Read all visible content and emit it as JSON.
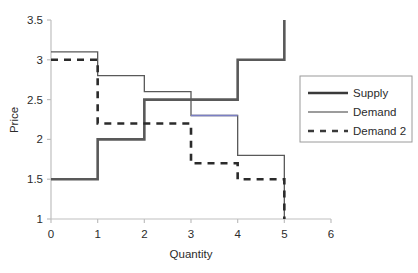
{
  "chart_data": {
    "type": "line",
    "subtype": "step",
    "title": "",
    "xlabel": "Quantity",
    "ylabel": "Price",
    "xlim": [
      0,
      6
    ],
    "ylim": [
      1,
      3.5
    ],
    "xticks": [
      "0",
      "1",
      "2",
      "3",
      "4",
      "5",
      "6"
    ],
    "xtick_values": [
      0,
      1,
      2,
      3,
      4,
      5,
      6
    ],
    "yticks": [
      "1",
      "1.5",
      "2",
      "2.5",
      "3",
      "3.5"
    ],
    "ytick_values": [
      1,
      1.5,
      2,
      2.5,
      3,
      3.5
    ],
    "grid": false,
    "legend_position": "right",
    "series": [
      {
        "name": "Supply",
        "style": "thick-solid",
        "color": "#595959",
        "steps": [
          {
            "x_start": 0,
            "x_end": 1,
            "y": 1.5
          },
          {
            "x_start": 1,
            "x_end": 2,
            "y": 2.0
          },
          {
            "x_start": 2,
            "x_end": 4,
            "y": 2.5
          },
          {
            "x_start": 4,
            "x_end": 5,
            "y": 3.0
          },
          {
            "x_start": 5,
            "x_end": 5,
            "y": 3.5
          }
        ]
      },
      {
        "name": "Demand",
        "style": "thin-solid",
        "color": "#595959",
        "accent_color": "#7b7fc4",
        "steps": [
          {
            "x_start": 0,
            "x_end": 1,
            "y": 3.1
          },
          {
            "x_start": 1,
            "x_end": 2,
            "y": 2.8
          },
          {
            "x_start": 2,
            "x_end": 3,
            "y": 2.6
          },
          {
            "x_start": 3,
            "x_end": 4,
            "y": 2.3
          },
          {
            "x_start": 4,
            "x_end": 5,
            "y": 1.8
          },
          {
            "x_start": 5,
            "x_end": 5,
            "y": 1.0
          }
        ]
      },
      {
        "name": "Demand 2",
        "style": "dashed",
        "color": "#2b2b2b",
        "steps": [
          {
            "x_start": 0,
            "x_end": 1,
            "y": 3.0
          },
          {
            "x_start": 1,
            "x_end": 3,
            "y": 2.2
          },
          {
            "x_start": 3,
            "x_end": 4,
            "y": 1.7
          },
          {
            "x_start": 4,
            "x_end": 5,
            "y": 1.5
          },
          {
            "x_start": 5,
            "x_end": 5,
            "y": 1.0
          }
        ]
      }
    ]
  },
  "legend": {
    "entries": [
      {
        "label": "Supply",
        "swatch": "thick-solid-swatch"
      },
      {
        "label": "Demand",
        "swatch": "thin-solid-swatch"
      },
      {
        "label": "Demand 2",
        "swatch": "dashed-swatch"
      }
    ]
  },
  "colors": {
    "axis": "#bfbfbf",
    "supply": "#595959",
    "demand": "#595959",
    "demand_accent": "#7b7fc4",
    "demand2": "#2b2b2b",
    "legend_border": "#9a9a9a",
    "text": "#2b2b2b",
    "background": "#ffffff"
  }
}
